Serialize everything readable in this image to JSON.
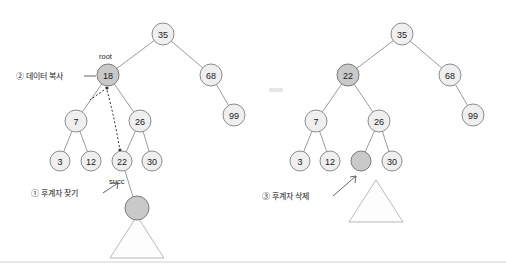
{
  "figure": {
    "title": "",
    "annotations": {
      "copy_data": "② 데이터 복사",
      "find_successor": "① 후계자 찾기",
      "delete_successor": "③ 후계자 삭제",
      "root_label": "root",
      "succ_label": "succ"
    }
  },
  "left_tree": {
    "nodes": [
      {
        "id": "l35",
        "label": "35",
        "cx": 163,
        "cy": 34,
        "r": 11,
        "highlight": false
      },
      {
        "id": "l18",
        "label": "18",
        "cx": 108,
        "cy": 75,
        "r": 11,
        "highlight": true
      },
      {
        "id": "l68",
        "label": "68",
        "cx": 211,
        "cy": 75,
        "r": 11,
        "highlight": false
      },
      {
        "id": "l99",
        "label": "99",
        "cx": 234,
        "cy": 115,
        "r": 11,
        "highlight": false
      },
      {
        "id": "l7",
        "label": "7",
        "cx": 76,
        "cy": 121,
        "r": 11,
        "highlight": false
      },
      {
        "id": "l26",
        "label": "26",
        "cx": 140,
        "cy": 121,
        "r": 11,
        "highlight": false
      },
      {
        "id": "l3",
        "label": "3",
        "cx": 60,
        "cy": 161,
        "r": 10,
        "highlight": false
      },
      {
        "id": "l12",
        "label": "12",
        "cx": 91,
        "cy": 161,
        "r": 10,
        "highlight": false
      },
      {
        "id": "l22",
        "label": "22",
        "cx": 122,
        "cy": 161,
        "r": 10,
        "highlight": false
      },
      {
        "id": "l30",
        "label": "30",
        "cx": 152,
        "cy": 161,
        "r": 10,
        "highlight": false
      },
      {
        "id": "lsub",
        "label": "",
        "cx": 137,
        "cy": 208,
        "r": 12,
        "highlight": true
      }
    ],
    "edges": [
      [
        "l35",
        "l18"
      ],
      [
        "l35",
        "l68"
      ],
      [
        "l68",
        "l99"
      ],
      [
        "l18",
        "l7"
      ],
      [
        "l18",
        "l26"
      ],
      [
        "l7",
        "l3"
      ],
      [
        "l7",
        "l12"
      ],
      [
        "l26",
        "l22"
      ],
      [
        "l26",
        "l30"
      ],
      [
        "l22",
        "lsub"
      ]
    ],
    "triangle": {
      "apex_x": 137,
      "apex_y": 216,
      "half_width": 27,
      "base_y": 258
    }
  },
  "right_tree": {
    "nodes": [
      {
        "id": "r35",
        "label": "35",
        "cx": 402,
        "cy": 34,
        "r": 11,
        "highlight": false
      },
      {
        "id": "r22",
        "label": "22",
        "cx": 348,
        "cy": 75,
        "r": 11,
        "highlight": true
      },
      {
        "id": "r68",
        "label": "68",
        "cx": 450,
        "cy": 75,
        "r": 11,
        "highlight": false
      },
      {
        "id": "r99",
        "label": "99",
        "cx": 473,
        "cy": 115,
        "r": 11,
        "highlight": false
      },
      {
        "id": "r7",
        "label": "7",
        "cx": 316,
        "cy": 121,
        "r": 11,
        "highlight": false
      },
      {
        "id": "r26",
        "label": "26",
        "cx": 379,
        "cy": 121,
        "r": 11,
        "highlight": false
      },
      {
        "id": "r3",
        "label": "3",
        "cx": 300,
        "cy": 161,
        "r": 10,
        "highlight": false
      },
      {
        "id": "r12",
        "label": "12",
        "cx": 330,
        "cy": 161,
        "r": 10,
        "highlight": false
      },
      {
        "id": "rempty",
        "label": "",
        "cx": 361,
        "cy": 161,
        "r": 10,
        "highlight": true
      },
      {
        "id": "r30",
        "label": "30",
        "cx": 392,
        "cy": 161,
        "r": 10,
        "highlight": false
      }
    ],
    "edges": [
      [
        "r35",
        "r22"
      ],
      [
        "r35",
        "r68"
      ],
      [
        "r68",
        "r99"
      ],
      [
        "r22",
        "r7"
      ],
      [
        "r22",
        "r26"
      ],
      [
        "r7",
        "r3"
      ],
      [
        "r7",
        "r12"
      ],
      [
        "r26",
        "rempty"
      ],
      [
        "r26",
        "r30"
      ]
    ],
    "triangle": {
      "apex_x": 376,
      "apex_y": 180,
      "half_width": 27,
      "base_y": 222
    }
  },
  "colors": {
    "node_fill": "#efefef",
    "node_highlight_fill": "#c9c9c9",
    "node_stroke": "#8c8c8c",
    "edge": "#9a9a9a",
    "text": "#1a1a1a"
  }
}
